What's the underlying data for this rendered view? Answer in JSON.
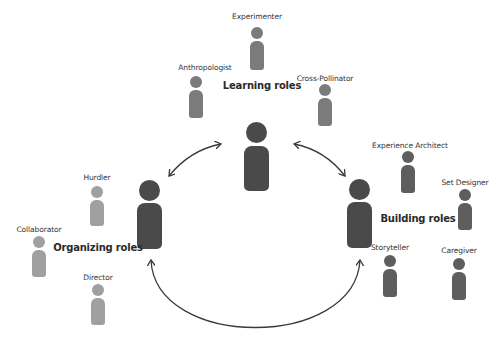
{
  "diagram": {
    "groups": {
      "learning": {
        "label": "Learning roles",
        "color": "#4a4a4a",
        "member_color": "#7b7b7b"
      },
      "organizing": {
        "label": "Organizing roles",
        "color": "#4a4a4a",
        "member_color": "#a0a0a0"
      },
      "building": {
        "label": "Building roles",
        "color": "#4a4a4a",
        "member_color": "#5e5e5e"
      }
    },
    "roles": {
      "experimenter": "Experimenter",
      "anthropologist": "Anthropologist",
      "cross_pollinator": "Cross-Pollinator",
      "hurdler": "Hurdler",
      "collaborator": "Collaborator",
      "director": "Director",
      "experience_architect": "Experience Architect",
      "set_designer": "Set Designer",
      "storyteller": "Storyteller",
      "caregiver": "Caregiver"
    },
    "connectors": [
      {
        "from": "learning",
        "to": "organizing",
        "type": "double-arrow"
      },
      {
        "from": "learning",
        "to": "building",
        "type": "double-arrow"
      },
      {
        "from": "organizing",
        "to": "building",
        "type": "double-arrow"
      }
    ],
    "arrow_color": "#3a3a3a"
  }
}
